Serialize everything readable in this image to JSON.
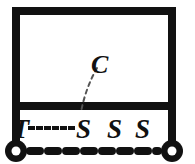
{
  "figure": {
    "background_color": "#ffffff",
    "ink_color": "#111111",
    "width": 195,
    "height": 164
  },
  "labels": {
    "top_member": "C",
    "left_node": "T",
    "mid_node_1": "S",
    "mid_node_2": "S",
    "mid_node_3": "S"
  },
  "elements": {
    "frame_label": "rectangular frame",
    "crossbeam_label": "horizontal beam",
    "left_post_label": "left column",
    "right_post_label": "right column",
    "left_support_label": "left pin support",
    "right_support_label": "right pin support",
    "ground_line_label": "dashed ground line",
    "leader_curve_label": "dashed leader curve to C",
    "dotted_connector_label": "dotted connector from T to S"
  }
}
